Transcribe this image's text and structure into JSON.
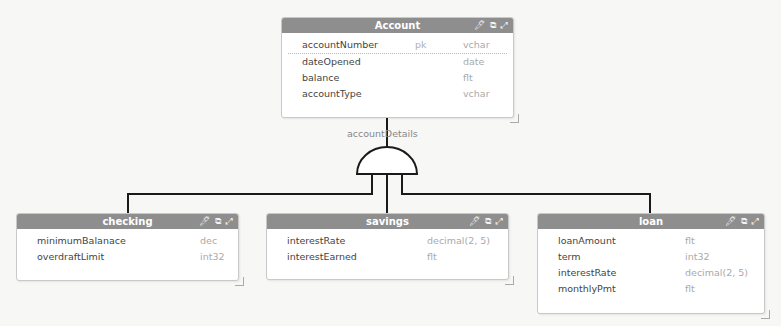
{
  "diagram": {
    "type": "entity-relationship",
    "relationship_label": "accountDetails",
    "relationship_type": "and-gate (inheritance/total specialization)",
    "colors": {
      "header": "#8e8e8e",
      "header_text": "#ffffff",
      "line": "#1a1a1a",
      "background": "#f7f7f6"
    },
    "header_icons": [
      "pin-icon",
      "edit-icon",
      "expand-icon"
    ],
    "entities": {
      "account": {
        "title": "Account",
        "fields": [
          {
            "name": "accountNumber",
            "key": "pk",
            "type": "vchar"
          },
          {
            "name": "dateOpened",
            "key": "",
            "type": "date"
          },
          {
            "name": "balance",
            "key": "",
            "type": "flt"
          },
          {
            "name": "accountType",
            "key": "",
            "type": "vchar"
          }
        ]
      },
      "checking": {
        "title": "checking",
        "fields": [
          {
            "name": "minimumBalanace",
            "type": "dec"
          },
          {
            "name": "overdraftLimit",
            "type": "int32"
          }
        ]
      },
      "savings": {
        "title": "savings",
        "fields": [
          {
            "name": "interestRate",
            "type": "decimal(2, 5)"
          },
          {
            "name": "interestEarned",
            "type": "flt"
          }
        ]
      },
      "loan": {
        "title": "loan",
        "fields": [
          {
            "name": "loanAmount",
            "type": "flt"
          },
          {
            "name": "term",
            "type": "int32"
          },
          {
            "name": "interestRate",
            "type": "decimal(2, 5)"
          },
          {
            "name": "monthlyPmt",
            "type": "flt"
          }
        ]
      }
    }
  }
}
